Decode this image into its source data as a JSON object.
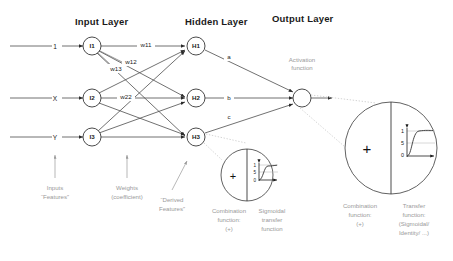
{
  "titles": {
    "input_layer": "Input Layer",
    "hidden_layer": "Hidden Layer",
    "output_layer": "Output Layer"
  },
  "inputs": [
    {
      "signal": "1",
      "node": "I1"
    },
    {
      "signal": "X",
      "node": "I2"
    },
    {
      "signal": "Y",
      "node": "I3"
    }
  ],
  "hidden_nodes": [
    {
      "node": "H1"
    },
    {
      "node": "H2"
    },
    {
      "node": "H3"
    }
  ],
  "weights": {
    "w11": "w11",
    "w12": "w12",
    "w13": "w13",
    "w22": "w22"
  },
  "output_weights": {
    "a": "a",
    "b": "b",
    "c": "c"
  },
  "annotations": {
    "inputs_line1": "Inputs",
    "inputs_line2": "“Features”",
    "weights_line1": "Weights",
    "weights_line2": "(coefficient)",
    "derived_line1": "“Derived",
    "derived_line2": "Features”",
    "activation_line1": "Activation",
    "activation_line2": "function"
  },
  "small_detail": {
    "plus": "+",
    "axis_top": "1",
    "axis_mid": "5",
    "axis_bottom": "0",
    "caption_left": [
      "Combination",
      "function:",
      "(+)"
    ],
    "caption_right": [
      "Sigmoidal",
      "transfer",
      "function"
    ]
  },
  "large_detail": {
    "plus": "+",
    "axis_top": "1",
    "axis_mid": "5",
    "axis_bottom": "0",
    "caption_left": [
      "Combination",
      "function:",
      "(+)"
    ],
    "caption_right": [
      "Transfer",
      "function:",
      "(Sigmoidal/",
      "Identity/ ...)"
    ]
  },
  "colors": {
    "ink": "#1a1a1a",
    "line": "#4d4d4d",
    "annotation": "#9a9a9a",
    "callout": "#c9c9c9",
    "background": "#ffffff"
  }
}
